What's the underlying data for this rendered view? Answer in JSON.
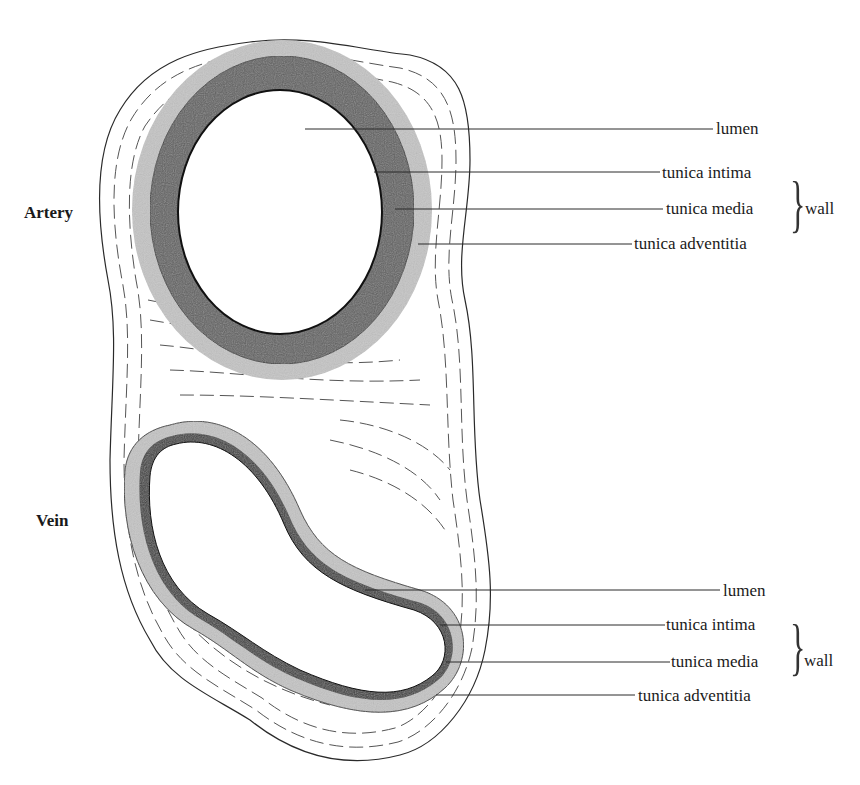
{
  "figure": {
    "colors": {
      "line": "#2a2a2a",
      "tunica_media_artery": "#5a5a5a",
      "tunica_adventitia": "#bdbdbd",
      "tunica_media_vein": "#3a3a3a",
      "lumen": "#ffffff"
    }
  },
  "artery": {
    "side_label": "Artery",
    "labels": {
      "lumen": "lumen",
      "intima": "tunica intima",
      "media": "tunica media",
      "adventitia": "tunica adventitia"
    },
    "group_label": "wall"
  },
  "vein": {
    "side_label": "Vein",
    "labels": {
      "lumen": "lumen",
      "intima": "tunica intima",
      "media": "tunica media",
      "adventitia": "tunica adventitia"
    },
    "group_label": "wall"
  }
}
